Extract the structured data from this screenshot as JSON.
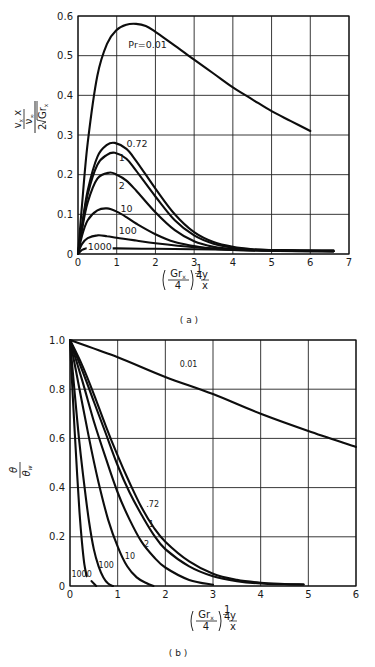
{
  "chart_data": [
    {
      "id": "a",
      "type": "line",
      "caption": "( a )",
      "title": "",
      "xlabel": "(Gr_x / 4)^(1/4) · y / x",
      "xlabel_parts": {
        "num": "Gr",
        "num_sub": "x",
        "den": "4",
        "exp": "1/4",
        "frac_num": "y",
        "frac_den": "x"
      },
      "ylabel": "(v_x x / ν_∞) / (2√Gr_x)",
      "ylabel_parts": {
        "num_a": "v",
        "num_a_sub": "x",
        "num_b": "x",
        "num_den": "ν",
        "num_den_sub": "∞",
        "den_coef": "2",
        "den_root": "Gr",
        "den_root_sub": "x"
      },
      "xlim": [
        0,
        7
      ],
      "ylim": [
        0,
        0.6
      ],
      "xticks": [
        "0",
        "1",
        "2",
        "3",
        "4",
        "5",
        "6",
        "7"
      ],
      "yticks": [
        "0",
        "0.1",
        "0.2",
        "0.3",
        "0.4",
        "0.5",
        "0.6"
      ],
      "grid": true,
      "legend": "inline curve labels",
      "series": [
        {
          "name": "Pr=0.01",
          "label": "Pr=0.01",
          "x": [
            0,
            0.1,
            0.25,
            0.5,
            0.75,
            1.0,
            1.25,
            1.5,
            1.75,
            2.0,
            2.5,
            3.0,
            3.5,
            4.0,
            4.5,
            5.0,
            5.5,
            6.0
          ],
          "y": [
            0,
            0.12,
            0.28,
            0.45,
            0.53,
            0.565,
            0.578,
            0.58,
            0.575,
            0.56,
            0.525,
            0.49,
            0.455,
            0.42,
            0.39,
            0.36,
            0.335,
            0.31
          ]
        },
        {
          "name": "Pr=0.72",
          "label": "0.72",
          "x": [
            0,
            0.1,
            0.25,
            0.5,
            0.75,
            0.95,
            1.25,
            1.5,
            2.0,
            2.5,
            3.0,
            3.5,
            4.0,
            4.5,
            5.0,
            6.0,
            6.6
          ],
          "y": [
            0,
            0.07,
            0.16,
            0.245,
            0.275,
            0.28,
            0.265,
            0.235,
            0.165,
            0.1,
            0.055,
            0.03,
            0.018,
            0.012,
            0.01,
            0.008,
            0.007
          ]
        },
        {
          "name": "Pr=1",
          "label": "1",
          "x": [
            0,
            0.1,
            0.25,
            0.5,
            0.75,
            0.95,
            1.25,
            1.5,
            2.0,
            2.5,
            3.0,
            3.5,
            4.0,
            4.5,
            5.0,
            6.0,
            6.6
          ],
          "y": [
            0,
            0.065,
            0.15,
            0.225,
            0.25,
            0.255,
            0.24,
            0.21,
            0.145,
            0.085,
            0.047,
            0.026,
            0.016,
            0.011,
            0.009,
            0.007,
            0.007
          ]
        },
        {
          "name": "Pr=2",
          "label": "2",
          "x": [
            0,
            0.1,
            0.25,
            0.5,
            0.8,
            1.0,
            1.25,
            1.5,
            2.0,
            2.5,
            3.0,
            3.5,
            4.0,
            5.0,
            6.0,
            6.6
          ],
          "y": [
            0,
            0.06,
            0.13,
            0.19,
            0.205,
            0.2,
            0.185,
            0.16,
            0.105,
            0.06,
            0.032,
            0.018,
            0.012,
            0.008,
            0.007,
            0.007
          ]
        },
        {
          "name": "Pr=10",
          "label": "10",
          "x": [
            0,
            0.1,
            0.25,
            0.5,
            0.75,
            1.0,
            1.25,
            1.5,
            2.0,
            2.5,
            3.0,
            3.5,
            4.0,
            5.0,
            6.6
          ],
          "y": [
            0,
            0.045,
            0.085,
            0.11,
            0.115,
            0.107,
            0.093,
            0.077,
            0.05,
            0.03,
            0.02,
            0.013,
            0.01,
            0.008,
            0.007
          ]
        },
        {
          "name": "Pr=100",
          "label": "100",
          "x": [
            0,
            0.1,
            0.25,
            0.5,
            0.75,
            1.0,
            1.5,
            2.0,
            3.0,
            4.0,
            5.0,
            6.6
          ],
          "y": [
            0,
            0.025,
            0.04,
            0.047,
            0.045,
            0.041,
            0.034,
            0.027,
            0.017,
            0.011,
            0.009,
            0.007
          ]
        },
        {
          "name": "Pr=1000",
          "label": "1000",
          "x": [
            0,
            0.1,
            0.2,
            0.35,
            0.6,
            1.0,
            2.0,
            3.0,
            4.0,
            5.0,
            6.6
          ],
          "y": [
            0,
            0.01,
            0.014,
            0.016,
            0.015,
            0.014,
            0.013,
            0.012,
            0.011,
            0.01,
            0.009
          ]
        }
      ],
      "label_positions": [
        {
          "text": "Pr=0.01",
          "x": 1.3,
          "y": 0.52
        },
        {
          "text": "0.72",
          "x": 1.25,
          "y": 0.27
        },
        {
          "text": "1",
          "x": 1.05,
          "y": 0.235
        },
        {
          "text": "2",
          "x": 1.05,
          "y": 0.165
        },
        {
          "text": "10",
          "x": 1.1,
          "y": 0.105
        },
        {
          "text": "100",
          "x": 1.05,
          "y": 0.05
        },
        {
          "text": "1000",
          "x": 0.25,
          "y": 0.01
        }
      ]
    },
    {
      "id": "b",
      "type": "line",
      "caption": "( b )",
      "title": "",
      "xlabel": "(Gr_x / 4)^(1/4) · y / x",
      "xlabel_parts": {
        "num": "Gr",
        "num_sub": "x",
        "den": "4",
        "exp": "1/4",
        "frac_num": "y",
        "frac_den": "x"
      },
      "ylabel": "θ / θ_w",
      "ylabel_parts": {
        "num": "θ",
        "den": "θ",
        "den_sub": "w"
      },
      "xlim": [
        0,
        6
      ],
      "ylim": [
        0,
        1.0
      ],
      "xticks": [
        "0",
        "1",
        "2",
        "3",
        "4",
        "5",
        "6"
      ],
      "yticks": [
        "0",
        "0.2",
        "0.4",
        "0.6",
        "0.8",
        "1.0"
      ],
      "grid": true,
      "legend": "inline curve labels",
      "series": [
        {
          "name": "Pr=0.01",
          "label": "0.01",
          "x": [
            0,
            1,
            2,
            3,
            4,
            5,
            6
          ],
          "y": [
            1.0,
            0.93,
            0.85,
            0.78,
            0.7,
            0.63,
            0.565
          ]
        },
        {
          "name": "Pr=0.72",
          "label": ".72",
          "x": [
            0,
            0.25,
            0.5,
            0.75,
            1.0,
            1.25,
            1.5,
            1.75,
            2.0,
            2.5,
            3.0,
            3.5,
            4.0,
            4.5,
            4.9
          ],
          "y": [
            1.0,
            0.9,
            0.78,
            0.65,
            0.53,
            0.42,
            0.32,
            0.24,
            0.18,
            0.1,
            0.05,
            0.025,
            0.013,
            0.008,
            0.006
          ]
        },
        {
          "name": "Pr=1",
          "label": "1",
          "x": [
            0,
            0.25,
            0.5,
            0.75,
            1.0,
            1.25,
            1.5,
            1.75,
            2.0,
            2.5,
            3.0,
            3.5,
            4.0,
            4.5,
            4.9
          ],
          "y": [
            1.0,
            0.88,
            0.75,
            0.62,
            0.49,
            0.38,
            0.29,
            0.21,
            0.15,
            0.08,
            0.04,
            0.02,
            0.01,
            0.007,
            0.006
          ]
        },
        {
          "name": "Pr=2",
          "label": "2",
          "x": [
            0,
            0.25,
            0.5,
            0.75,
            1.0,
            1.25,
            1.5,
            1.75,
            2.0,
            2.5,
            3.0
          ],
          "y": [
            1.0,
            0.84,
            0.67,
            0.52,
            0.38,
            0.27,
            0.18,
            0.12,
            0.075,
            0.025,
            0.005
          ]
        },
        {
          "name": "Pr=10",
          "label": "10",
          "x": [
            0,
            0.2,
            0.4,
            0.6,
            0.8,
            1.0,
            1.2,
            1.4,
            1.6,
            1.75
          ],
          "y": [
            1.0,
            0.8,
            0.6,
            0.42,
            0.27,
            0.16,
            0.08,
            0.035,
            0.012,
            0.0
          ]
        },
        {
          "name": "Pr=100",
          "label": "100",
          "x": [
            0,
            0.1,
            0.2,
            0.3,
            0.4,
            0.5,
            0.6,
            0.7,
            0.8,
            0.9
          ],
          "y": [
            1.0,
            0.78,
            0.58,
            0.41,
            0.26,
            0.15,
            0.08,
            0.035,
            0.01,
            0.0
          ]
        },
        {
          "name": "Pr=1000",
          "label": "1000",
          "x": [
            0,
            0.05,
            0.1,
            0.15,
            0.2,
            0.25,
            0.3,
            0.35
          ],
          "y": [
            1.0,
            0.8,
            0.62,
            0.45,
            0.3,
            0.18,
            0.09,
            0.04
          ]
        },
        {
          "name": "Pr=1000 (tail)",
          "label": "",
          "x": [
            0.45,
            0.5,
            0.55
          ],
          "y": [
            0.02,
            0.01,
            0.0
          ]
        }
      ],
      "label_positions": [
        {
          "text": "0.01",
          "x": 2.3,
          "y": 0.89
        },
        {
          "text": ".72",
          "x": 1.6,
          "y": 0.32
        },
        {
          "text": "1",
          "x": 1.65,
          "y": 0.24
        },
        {
          "text": "2",
          "x": 1.55,
          "y": 0.16
        },
        {
          "text": "10",
          "x": 1.15,
          "y": 0.11
        },
        {
          "text": "100",
          "x": 0.6,
          "y": 0.075
        },
        {
          "text": "1000",
          "x": 0.03,
          "y": 0.035
        }
      ]
    }
  ]
}
